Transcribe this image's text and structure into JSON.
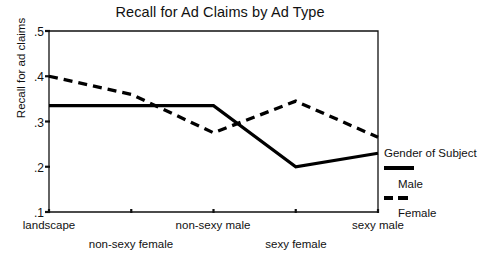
{
  "chart_data": {
    "type": "line",
    "title": "Recall for Ad Claims by Ad Type",
    "xlabel": "",
    "ylabel": "Recall for ad claims",
    "categories": [
      "landscape",
      "non-sexy female",
      "non-sexy male",
      "sexy female",
      "sexy male"
    ],
    "ylim": [
      0.1,
      0.5
    ],
    "ytick_labels": [
      ".5",
      ".4",
      ".3",
      ".2",
      ".1"
    ],
    "ytick_values": [
      0.5,
      0.4,
      0.3,
      0.2,
      0.1
    ],
    "grid": false,
    "legend_position": "right",
    "series": [
      {
        "name": "Male",
        "style": "solid",
        "color": "#000000",
        "values": [
          0.335,
          0.335,
          0.335,
          0.2,
          0.23
        ]
      },
      {
        "name": "Female",
        "style": "dashed",
        "color": "#000000",
        "values": [
          0.4,
          0.36,
          0.275,
          0.345,
          0.265
        ]
      }
    ]
  },
  "legend": {
    "title": "Gender of Subject",
    "entries": [
      {
        "label": "Male",
        "style": "solid"
      },
      {
        "label": "Female",
        "style": "dashed"
      }
    ]
  }
}
